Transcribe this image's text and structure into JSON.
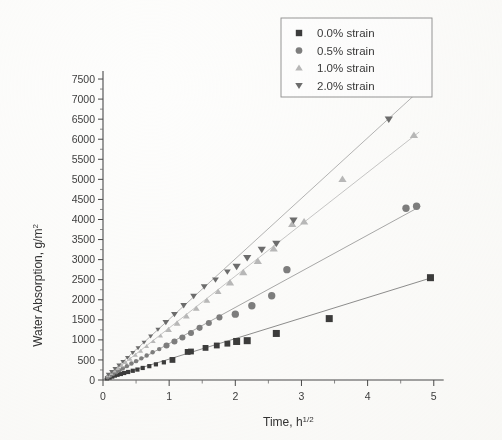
{
  "chart_data": {
    "type": "scatter",
    "title": "",
    "xlabel": "Time,  h",
    "xlabel_sup": "1/2",
    "ylabel": "Water Absorption, g/m",
    "ylabel_sup": "2",
    "xlim": [
      0,
      5.2
    ],
    "ylim": [
      0,
      7800
    ],
    "xticks": [
      0,
      1,
      2,
      3,
      4,
      5
    ],
    "xticklabels": [
      "0",
      "1",
      "2",
      "3",
      "4",
      "5"
    ],
    "yticks": [
      0,
      500,
      1000,
      1500,
      2000,
      2500,
      3000,
      3500,
      4000,
      4500,
      5000,
      5500,
      6000,
      6500,
      7000,
      7500
    ],
    "yticklabels": [
      "0",
      "500",
      "1000",
      "1500",
      "2000",
      "2500",
      "3000",
      "3500",
      "4000",
      "4500",
      "5000",
      "5500",
      "6000",
      "6500",
      "7000",
      "7500"
    ],
    "grid": false,
    "legend_position": "top-right",
    "series": [
      {
        "name": "0.0% strain",
        "marker": "square",
        "color": "#3c3c3c",
        "trend_color": "#7a7a7a",
        "trend": [
          [
            0.02,
            20
          ],
          [
            4.98,
            2555
          ]
        ],
        "points": [
          [
            0.06,
            40
          ],
          [
            0.1,
            60
          ],
          [
            0.14,
            85
          ],
          [
            0.18,
            110
          ],
          [
            0.22,
            130
          ],
          [
            0.27,
            150
          ],
          [
            0.32,
            175
          ],
          [
            0.38,
            200
          ],
          [
            0.45,
            230
          ],
          [
            0.52,
            260
          ],
          [
            0.6,
            300
          ],
          [
            0.7,
            345
          ],
          [
            0.8,
            390
          ],
          [
            0.92,
            440
          ],
          [
            1.05,
            500
          ],
          [
            1.28,
            700
          ],
          [
            1.33,
            710
          ],
          [
            1.55,
            800
          ],
          [
            1.72,
            860
          ],
          [
            1.88,
            905
          ],
          [
            2.02,
            960
          ],
          [
            2.18,
            980
          ],
          [
            2.62,
            1160
          ],
          [
            3.42,
            1530
          ],
          [
            4.95,
            2550
          ]
        ]
      },
      {
        "name": "0.5% strain",
        "marker": "circle",
        "color": "#7e7e7e",
        "trend_color": "#9a9a9a",
        "trend": [
          [
            0.02,
            25
          ],
          [
            4.8,
            4330
          ]
        ],
        "points": [
          [
            0.07,
            70
          ],
          [
            0.11,
            110
          ],
          [
            0.15,
            150
          ],
          [
            0.2,
            195
          ],
          [
            0.25,
            240
          ],
          [
            0.3,
            290
          ],
          [
            0.36,
            345
          ],
          [
            0.43,
            410
          ],
          [
            0.5,
            470
          ],
          [
            0.58,
            540
          ],
          [
            0.66,
            610
          ],
          [
            0.75,
            690
          ],
          [
            0.85,
            770
          ],
          [
            0.96,
            860
          ],
          [
            1.08,
            960
          ],
          [
            1.2,
            1060
          ],
          [
            1.33,
            1170
          ],
          [
            1.46,
            1300
          ],
          [
            1.6,
            1420
          ],
          [
            1.76,
            1560
          ],
          [
            2.0,
            1640
          ],
          [
            2.25,
            1850
          ],
          [
            2.55,
            2100
          ],
          [
            2.78,
            2750
          ],
          [
            4.58,
            4280
          ],
          [
            4.74,
            4330
          ]
        ]
      },
      {
        "name": "1.0% strain",
        "marker": "triangle-up",
        "color": "#b9b9b9",
        "trend_color": "#bdbdbd",
        "trend": [
          [
            0.02,
            30
          ],
          [
            4.78,
            6180
          ]
        ],
        "points": [
          [
            0.08,
            110
          ],
          [
            0.12,
            165
          ],
          [
            0.17,
            225
          ],
          [
            0.22,
            290
          ],
          [
            0.28,
            360
          ],
          [
            0.34,
            440
          ],
          [
            0.41,
            520
          ],
          [
            0.49,
            620
          ],
          [
            0.57,
            720
          ],
          [
            0.66,
            840
          ],
          [
            0.76,
            960
          ],
          [
            0.87,
            1100
          ],
          [
            0.99,
            1250
          ],
          [
            1.12,
            1410
          ],
          [
            1.26,
            1590
          ],
          [
            1.41,
            1780
          ],
          [
            1.57,
            1980
          ],
          [
            1.74,
            2200
          ],
          [
            1.92,
            2420
          ],
          [
            2.12,
            2680
          ],
          [
            2.34,
            2960
          ],
          [
            2.58,
            3270
          ],
          [
            2.86,
            3880
          ],
          [
            3.04,
            3940
          ],
          [
            3.62,
            5000
          ],
          [
            4.7,
            6100
          ]
        ]
      },
      {
        "name": "2.0% strain",
        "marker": "triangle-down",
        "color": "#6d6d6d",
        "trend_color": "#a8a8a8",
        "trend": [
          [
            0.02,
            35
          ],
          [
            4.86,
            7330
          ]
        ],
        "points": [
          [
            0.08,
            140
          ],
          [
            0.13,
            210
          ],
          [
            0.18,
            285
          ],
          [
            0.24,
            370
          ],
          [
            0.3,
            460
          ],
          [
            0.37,
            560
          ],
          [
            0.45,
            680
          ],
          [
            0.53,
            800
          ],
          [
            0.62,
            940
          ],
          [
            0.72,
            1090
          ],
          [
            0.83,
            1260
          ],
          [
            0.95,
            1440
          ],
          [
            1.08,
            1640
          ],
          [
            1.22,
            1860
          ],
          [
            1.37,
            2090
          ],
          [
            1.53,
            2330
          ],
          [
            1.7,
            2500
          ],
          [
            1.88,
            2700
          ],
          [
            2.02,
            2830
          ],
          [
            2.18,
            3050
          ],
          [
            2.4,
            3250
          ],
          [
            2.62,
            3400
          ],
          [
            2.88,
            3980
          ],
          [
            4.32,
            6500
          ]
        ]
      }
    ]
  },
  "legend": {
    "items": [
      {
        "label": "0.0% strain",
        "marker": "square",
        "color": "#3c3c3c"
      },
      {
        "label": "0.5% strain",
        "marker": "circle",
        "color": "#7e7e7e"
      },
      {
        "label": "1.0% strain",
        "marker": "triangle-up",
        "color": "#b9b9b9"
      },
      {
        "label": "2.0% strain",
        "marker": "triangle-down",
        "color": "#6d6d6d"
      }
    ]
  }
}
